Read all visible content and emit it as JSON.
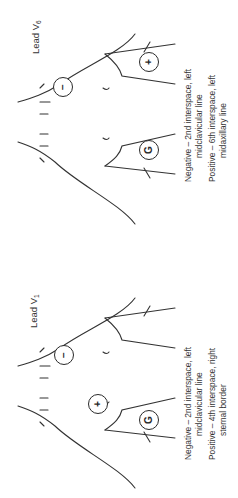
{
  "figure": {
    "orientation": "rotated 90deg counter-clockwise",
    "panels": [
      {
        "id": "v1",
        "lead_title": "Lead V",
        "lead_subscript": "1",
        "electrodes": {
          "negative": "−",
          "positive": "+",
          "ground": "G"
        },
        "captions": {
          "negative_label": "Negative – 2nd interspace, left",
          "negative_cont": "midclavicular line",
          "positive_label": "Positive – 4th interspace, right",
          "positive_cont": "sternal border"
        }
      },
      {
        "id": "v6",
        "lead_title": "Lead V",
        "lead_subscript": "6",
        "electrodes": {
          "negative": "−",
          "positive": "+",
          "ground": "G"
        },
        "captions": {
          "negative_label": "Negative – 2nd interspace, left",
          "negative_cont": "midclavicular line",
          "positive_label": "Positive – 6th interspace, left",
          "positive_cont": "midaxillary line"
        }
      }
    ]
  }
}
